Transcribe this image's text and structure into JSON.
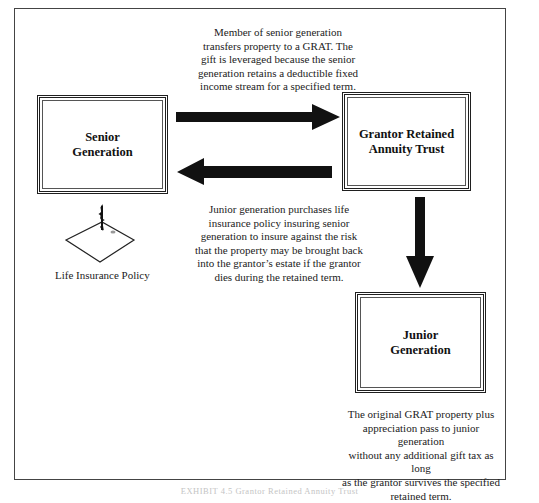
{
  "diagram": {
    "nodes": {
      "senior": {
        "label": "Senior\nGeneration"
      },
      "grat": {
        "label": "Grantor Retained\nAnnuity Trust"
      },
      "junior": {
        "label": "Junior\nGeneration"
      }
    },
    "notes": {
      "transfer": "Member of senior generation\ntransfers property to a GRAT. The\ngift is leveraged because the senior\ngeneration retains a deductible fixed\nincome stream for a specified term.",
      "insurance": "Junior generation purchases life\ninsurance policy insuring senior\ngeneration to insure against the risk\nthat the property may be brought back\ninto the grantor’s estate if the grantor\ndies during the retained term.",
      "remainder": "The original GRAT property plus\nappreciation pass to junior generation\nwithout any additional gift tax as long\nas the grantor survives the specified\nretained term."
    },
    "policy": {
      "icon": "life-insurance-policy-icon",
      "label": "Life Insurance Policy"
    },
    "edges": [
      {
        "from": "senior",
        "to": "grat",
        "direction": "right"
      },
      {
        "from": "grat",
        "to": "senior",
        "direction": "left"
      },
      {
        "from": "grat",
        "to": "junior",
        "direction": "down"
      }
    ],
    "caption": "EXHIBIT 4.5 Grantor Retained Annuity Trust",
    "colors": {
      "ink": "#111111",
      "frame": "#444444",
      "background": "#ffffff"
    }
  }
}
